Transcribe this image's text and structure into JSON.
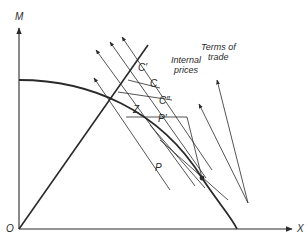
{
  "diagram": {
    "axes": {
      "y_label": "M",
      "x_label": "X",
      "origin_label": "O"
    },
    "points": {
      "P": "P",
      "P_prime": "P′",
      "C": "C",
      "C_prime": "C′",
      "C_double_prime": "C″",
      "Z": "Z"
    },
    "legend": {
      "internal_prices": [
        "Internal",
        "prices"
      ],
      "terms_of_trade": [
        "Terms of",
        "trade"
      ]
    },
    "colors": {
      "line": "#2a2a2a",
      "background": "#ffffff"
    }
  }
}
